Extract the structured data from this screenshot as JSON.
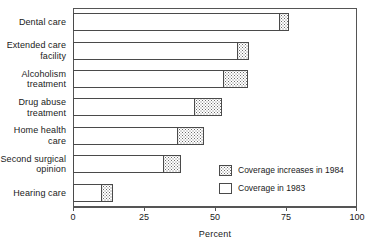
{
  "chart_data": {
    "type": "bar",
    "orientation": "horizontal",
    "stacked": true,
    "title": "",
    "xlabel": "Percent",
    "ylabel": "",
    "xlim": [
      0,
      100
    ],
    "xticks": [
      0,
      25,
      50,
      75,
      100
    ],
    "xtick_labels": [
      "0",
      "25",
      "50",
      "75",
      "100"
    ],
    "grid": false,
    "legend_position": "inside-lower-right",
    "categories": [
      "Dental care",
      "Extended care facility",
      "Alcoholism treatment",
      "Drug abuse treatment",
      "Home health care",
      "Second surgical opinion",
      "Hearing care"
    ],
    "series": [
      {
        "name": "Coverage in 1983",
        "fill": "white",
        "values": [
          73,
          58,
          53,
          43,
          37,
          32,
          10
        ]
      },
      {
        "name": "Coverage increases in 1984",
        "fill": "stipple",
        "values": [
          3,
          4,
          8.5,
          9.5,
          9,
          6,
          4
        ]
      }
    ],
    "totals": [
      76,
      62,
      61.5,
      52.5,
      46,
      38,
      14
    ]
  },
  "axis": {
    "x_title": "Percent",
    "ticks": [
      {
        "value": 0,
        "label": "0"
      },
      {
        "value": 25,
        "label": "25"
      },
      {
        "value": 50,
        "label": "50"
      },
      {
        "value": 75,
        "label": "75"
      },
      {
        "value": 100,
        "label": "100"
      }
    ]
  },
  "categories": [
    {
      "label_line1": "Dental care",
      "label_line2": ""
    },
    {
      "label_line1": "Extended care",
      "label_line2": "facility"
    },
    {
      "label_line1": "Alcoholism",
      "label_line2": "treatment"
    },
    {
      "label_line1": "Drug abuse",
      "label_line2": "treatment"
    },
    {
      "label_line1": "Home health",
      "label_line2": "care"
    },
    {
      "label_line1": "Second surgical",
      "label_line2": "opinion"
    },
    {
      "label_line1": "Hearing care",
      "label_line2": ""
    }
  ],
  "legend": {
    "items": [
      {
        "label": "Coverage increases in 1984",
        "style": "stipple"
      },
      {
        "label": "Coverage in 1983",
        "style": "white"
      }
    ]
  },
  "colors": {
    "axis": "#555555",
    "bar_outline": "#4a4a4a",
    "stipple_dot": "#6d6d6d",
    "base_fill": "#ffffff",
    "text": "#1a1a1a"
  }
}
